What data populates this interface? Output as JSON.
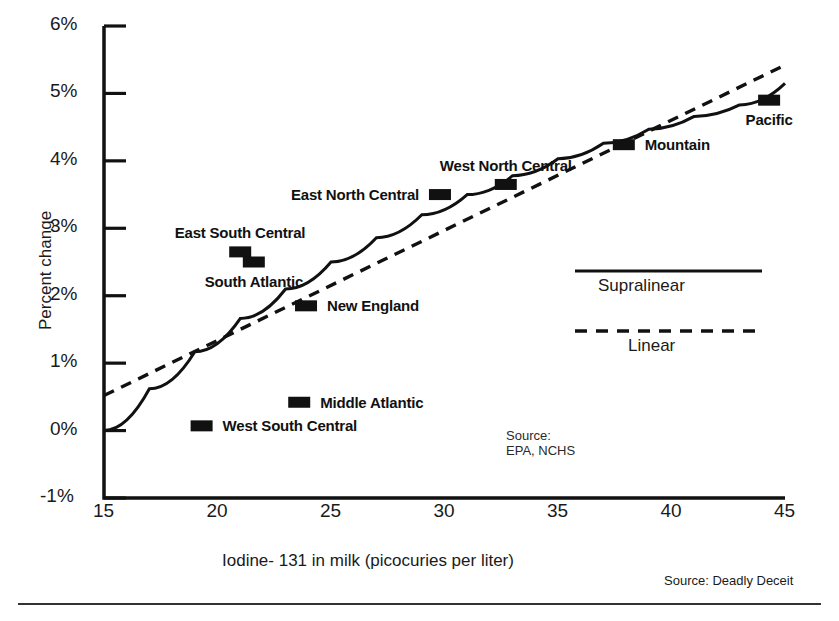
{
  "chart_data": {
    "type": "scatter",
    "title": "",
    "xlabel": "Iodine- 131 in milk (picocuries per liter)",
    "ylabel": "Percent change",
    "xlim": [
      15,
      45
    ],
    "ylim": [
      -1,
      6
    ],
    "xticks": [
      "15",
      "20",
      "25",
      "30",
      "35",
      "40",
      "45"
    ],
    "yticks": [
      "-1%",
      "0%",
      "1%",
      "2%",
      "3%",
      "4%",
      "5%",
      "6%"
    ],
    "grid": false,
    "legend_position": "center-right",
    "points": [
      {
        "label": "West South Central",
        "x": 19.3,
        "y": 0.07,
        "label_side": "right"
      },
      {
        "label": "East South Central",
        "x": 21.0,
        "y": 2.65,
        "label_side": "above"
      },
      {
        "label": "South Atlantic",
        "x": 21.6,
        "y": 2.5,
        "label_side": "below"
      },
      {
        "label": "Middle Atlantic",
        "x": 23.6,
        "y": 0.42,
        "label_side": "right"
      },
      {
        "label": "New England",
        "x": 23.9,
        "y": 1.85,
        "label_side": "right"
      },
      {
        "label": "East North Central",
        "x": 29.8,
        "y": 3.5,
        "label_side": "left"
      },
      {
        "label": "West North Central",
        "x": 32.7,
        "y": 3.65,
        "label_side": "above"
      },
      {
        "label": "Mountain",
        "x": 37.9,
        "y": 4.24,
        "label_side": "right"
      },
      {
        "label": "Pacific",
        "x": 44.3,
        "y": 4.9,
        "label_side": "below"
      }
    ],
    "series": [
      {
        "name": "Supralinear",
        "style": "solid",
        "points": [
          {
            "x": 15.0,
            "y": 0.0
          },
          {
            "x": 17.0,
            "y": 0.62
          },
          {
            "x": 19.0,
            "y": 1.17
          },
          {
            "x": 21.0,
            "y": 1.66
          },
          {
            "x": 23.0,
            "y": 2.1
          },
          {
            "x": 25.0,
            "y": 2.5
          },
          {
            "x": 27.0,
            "y": 2.86
          },
          {
            "x": 29.0,
            "y": 3.2
          },
          {
            "x": 31.0,
            "y": 3.5
          },
          {
            "x": 33.0,
            "y": 3.78
          },
          {
            "x": 35.0,
            "y": 4.03
          },
          {
            "x": 37.0,
            "y": 4.26
          },
          {
            "x": 39.0,
            "y": 4.47
          },
          {
            "x": 41.0,
            "y": 4.66
          },
          {
            "x": 43.0,
            "y": 4.83
          },
          {
            "x": 45.0,
            "y": 5.15
          }
        ]
      },
      {
        "name": "Linear",
        "style": "dashed",
        "points": [
          {
            "x": 15.0,
            "y": 0.52
          },
          {
            "x": 45.0,
            "y": 5.42
          }
        ]
      }
    ],
    "annotations": [
      {
        "name": "source-note",
        "text": "Source:\nEPA, NCHS"
      },
      {
        "name": "credit",
        "text": "Source: Deadly Deceit"
      }
    ]
  },
  "legend": {
    "supralinear_label": "Supralinear",
    "linear_label": "Linear"
  },
  "axes": {
    "x_title": "Iodine- 131 in milk (picocuries per liter)",
    "y_title": "Percent change"
  },
  "notes": {
    "source_block": "Source:\nEPA, NCHS",
    "credit": "Source: Deadly Deceit"
  }
}
